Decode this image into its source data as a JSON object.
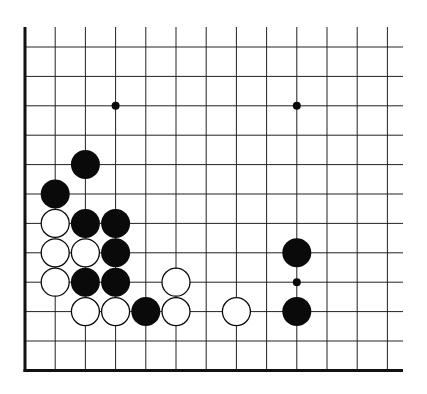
{
  "diagram": {
    "type": "go-board-fragment",
    "corner": "bottom-left",
    "columns": 13,
    "rows": 12,
    "colors": {
      "background": "#ffffff",
      "line": "#222222",
      "edge": "#111111",
      "black": "#0a0a0a",
      "white": "#ffffff"
    },
    "star_points": [
      [
        3,
        2
      ],
      [
        9,
        2
      ],
      [
        9,
        8
      ]
    ],
    "stones": {
      "black": [
        [
          2,
          4
        ],
        [
          1,
          5
        ],
        [
          2,
          6
        ],
        [
          3,
          6
        ],
        [
          3,
          7
        ],
        [
          2,
          8
        ],
        [
          3,
          8
        ],
        [
          4,
          9
        ],
        [
          9,
          7
        ],
        [
          9,
          9
        ]
      ],
      "white": [
        [
          1,
          6
        ],
        [
          1,
          7
        ],
        [
          2,
          7
        ],
        [
          1,
          8
        ],
        [
          5,
          8
        ],
        [
          2,
          9
        ],
        [
          3,
          9
        ],
        [
          5,
          9
        ],
        [
          7,
          9
        ]
      ]
    }
  }
}
